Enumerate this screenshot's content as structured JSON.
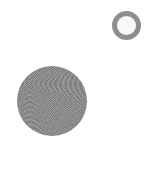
{
  "canvas": {
    "width": 149,
    "height": 170,
    "background_color": "#ffffff",
    "label": ""
  },
  "shapes": [
    {
      "name": "ring",
      "type": "circle-outline",
      "label": "",
      "fill_color": "#ffffff",
      "stroke_color": "#8e8e8e",
      "stroke_width": 5,
      "center_x": 126,
      "center_y": 25,
      "diameter": 29,
      "texture": "smooth"
    },
    {
      "name": "disc",
      "type": "circle-filled",
      "label": "",
      "fill_color": "#8b8b8b",
      "stroke_color": "#8b8b8b",
      "stroke_width": 0,
      "center_x": 52,
      "center_y": 101,
      "diameter": 70,
      "texture": "grainy"
    }
  ]
}
